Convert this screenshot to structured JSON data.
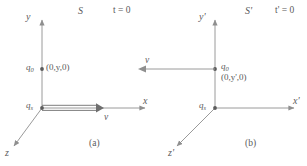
{
  "figure": {
    "colors": {
      "line": "#9a9a9a",
      "text": "#5b5b5b",
      "background": "#ffffff"
    },
    "panels": [
      {
        "id": "a",
        "caption": "(a)",
        "frame_label": "S",
        "time_label": "t = 0",
        "axes": {
          "y": "y",
          "x": "x",
          "z": "z"
        },
        "source_charge": {
          "symbol": "q",
          "subscript": "s"
        },
        "test_charge": {
          "symbol": "q",
          "subscript": "0",
          "coordinates": "(0,y,0)"
        },
        "velocity": {
          "label": "v",
          "direction": "right"
        }
      },
      {
        "id": "b",
        "caption": "(b)",
        "frame_label": "S'",
        "time_label": "t' = 0",
        "axes": {
          "y": "y'",
          "x": "x'",
          "z": "z'"
        },
        "source_charge": {
          "symbol": "q",
          "subscript": "s"
        },
        "test_charge": {
          "symbol": "q",
          "subscript": "0",
          "coordinates": "(0,y',0)"
        },
        "velocity": {
          "label": "v",
          "direction": "left"
        }
      }
    ]
  }
}
